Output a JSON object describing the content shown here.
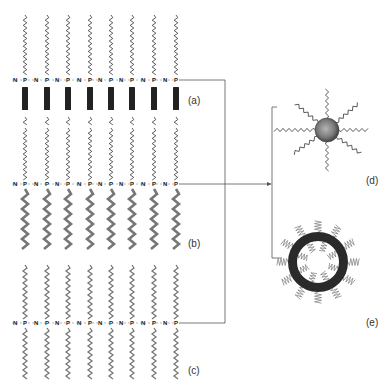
{
  "diagram": {
    "type": "polyphosphazene self-assembly schematic",
    "rows": [
      {
        "id": "a",
        "label": "(a)",
        "backbone_y": 80,
        "top_chain": "thin-wavy",
        "bottom_group": "black-bar",
        "connector_y": 80
      },
      {
        "id": "b",
        "label": "(b)",
        "backbone_y": 184,
        "top_chain": "thin-wavy",
        "bottom_group": "thick-gray-wavy",
        "connector_y": 184
      },
      {
        "id": "c",
        "label": "(c)",
        "backbone_y": 323,
        "top_chain": "gray-wavy",
        "bottom_group": "gray-wavy",
        "connector_y": 323
      }
    ],
    "backbone": {
      "atoms": [
        "N",
        "P"
      ],
      "repeat_units": 8,
      "p_x": [
        25,
        47,
        68,
        90,
        111,
        132,
        154,
        176
      ],
      "n_x": [
        15,
        36,
        57,
        79,
        100,
        121,
        143,
        165
      ]
    },
    "structures": [
      {
        "id": "d",
        "label": "(d)",
        "kind": "micelle-sphere-with-chains",
        "cx": 327,
        "cy": 130
      },
      {
        "id": "e",
        "label": "(e)",
        "kind": "vesicle-ring",
        "cx": 318,
        "cy": 262
      }
    ],
    "connectors": {
      "merge_x": 225,
      "bracket_x": 272,
      "bracket_top": 107,
      "bracket_bottom": 258,
      "arrow_y": 184
    },
    "colors": {
      "line": "#555555",
      "chain_dark": "#333333",
      "chain_gray": "#777777",
      "bar": "#222222",
      "sphere_core": "#9a9a9a",
      "sphere_edge": "#333333",
      "ring": "#2a2a2a"
    }
  }
}
